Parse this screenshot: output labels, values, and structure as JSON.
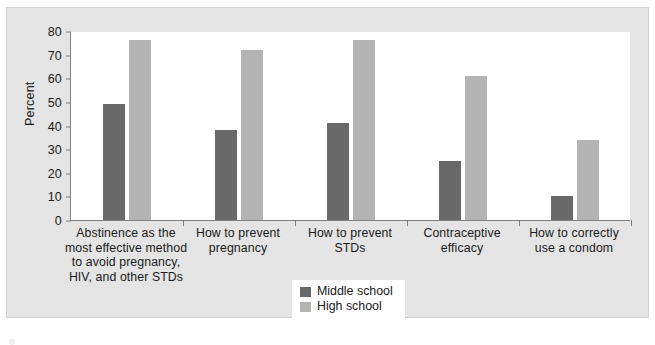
{
  "chart_data": {
    "type": "bar",
    "title": "",
    "xlabel": "",
    "ylabel": "Percent",
    "ylim": [
      0,
      80
    ],
    "ytick_step": 10,
    "yticks": [
      0,
      10,
      20,
      30,
      40,
      50,
      60,
      70,
      80
    ],
    "grid": false,
    "legend_position": "bottom-center",
    "categories": [
      "Abstinence as the most effective method to avoid pregnancy, HIV, and other STDs",
      "How to prevent pregnancy",
      "How to prevent STDs",
      "Contraceptive efficacy",
      "How to correctly use a condom"
    ],
    "category_lines": [
      [
        "Abstinence as the",
        "most effective method",
        "to avoid pregnancy,",
        "HIV, and other STDs"
      ],
      [
        "How to prevent",
        "pregnancy"
      ],
      [
        "How to prevent",
        "STDs"
      ],
      [
        "Contraceptive",
        "efficacy"
      ],
      [
        "How to correctly",
        "use a condom"
      ]
    ],
    "series": [
      {
        "name": "Middle school",
        "color": "#686868",
        "values": [
          49,
          38,
          41,
          25,
          10
        ]
      },
      {
        "name": "High school",
        "color": "#b3b3b3",
        "values": [
          76,
          72,
          76,
          61,
          34
        ]
      }
    ]
  },
  "colors": {
    "figure_background": "#e4e4e4",
    "plot_background": "#ffffff",
    "axis": "#808080",
    "text": "#1a1a1a",
    "middle_school": "#686868",
    "high_school": "#b3b3b3"
  }
}
